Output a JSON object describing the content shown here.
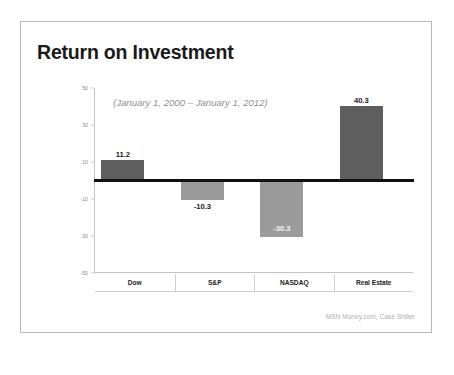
{
  "slide": {
    "title": "Return on Investment",
    "source": "MSN Money.com, Case Shiller"
  },
  "chart_data": {
    "type": "bar",
    "title": "Return on Investment",
    "subtitle": "(January 1, 2000 – January 1, 2012)",
    "categories": [
      "Dow",
      "S&P",
      "NASDAQ",
      "Real Estate"
    ],
    "values": [
      11.2,
      -10.3,
      -30.3,
      40.3
    ],
    "data_labels": [
      "11.2",
      "-10.3",
      "-30.3",
      "40.3"
    ],
    "xlabel": "",
    "ylabel": "",
    "ylim": [
      -50,
      50
    ],
    "yticks": [
      50,
      30,
      10,
      -10,
      -30,
      -50
    ],
    "ytick_labels": [
      "50",
      "30",
      "10",
      "-10",
      "-30",
      "-50"
    ],
    "grid": false,
    "legend": "none",
    "colors": {
      "positive_bar": "#5e5e5e",
      "negative_bar": "#9b9b9b",
      "zero_line": "#111111",
      "axis": "#c4c4c4",
      "tick_label": "#8c8c8c",
      "subtitle": "#8f8f8f",
      "title": "#1a1a1a",
      "source": "#b0b0b0"
    }
  }
}
